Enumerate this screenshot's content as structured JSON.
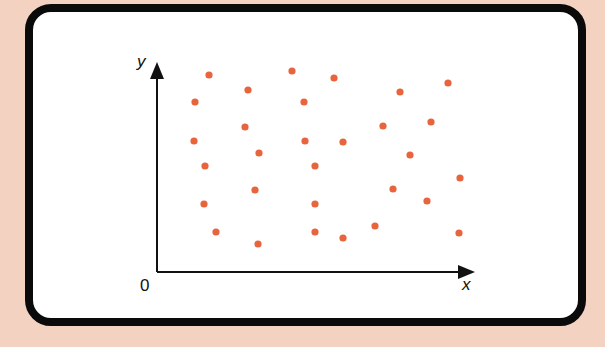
{
  "chart_data": {
    "type": "scatter",
    "title": "",
    "xlabel": "x",
    "ylabel": "y",
    "origin_label": "0",
    "grid": false,
    "legend": null,
    "axis_ticks": false,
    "point_color": "#e8643c",
    "frame_color": "#0a0a0a",
    "background_color": "#f3d2c2",
    "xlim": [
      0,
      320
    ],
    "ylim": [
      0,
      210
    ],
    "points": [
      {
        "x": 52,
        "y": 197
      },
      {
        "x": 135,
        "y": 201
      },
      {
        "x": 177,
        "y": 194
      },
      {
        "x": 291,
        "y": 189
      },
      {
        "x": 243,
        "y": 180
      },
      {
        "x": 91,
        "y": 182
      },
      {
        "x": 38,
        "y": 170
      },
      {
        "x": 147,
        "y": 170
      },
      {
        "x": 88,
        "y": 145
      },
      {
        "x": 226,
        "y": 146
      },
      {
        "x": 274,
        "y": 150
      },
      {
        "x": 37,
        "y": 131
      },
      {
        "x": 148,
        "y": 131
      },
      {
        "x": 186,
        "y": 130
      },
      {
        "x": 102,
        "y": 119
      },
      {
        "x": 253,
        "y": 117
      },
      {
        "x": 48,
        "y": 106
      },
      {
        "x": 158,
        "y": 106
      },
      {
        "x": 303,
        "y": 94
      },
      {
        "x": 98,
        "y": 82
      },
      {
        "x": 236,
        "y": 83
      },
      {
        "x": 270,
        "y": 71
      },
      {
        "x": 47,
        "y": 68
      },
      {
        "x": 158,
        "y": 68
      },
      {
        "x": 59,
        "y": 40
      },
      {
        "x": 158,
        "y": 40
      },
      {
        "x": 186,
        "y": 34
      },
      {
        "x": 218,
        "y": 46
      },
      {
        "x": 302,
        "y": 39
      },
      {
        "x": 101,
        "y": 28
      }
    ]
  }
}
